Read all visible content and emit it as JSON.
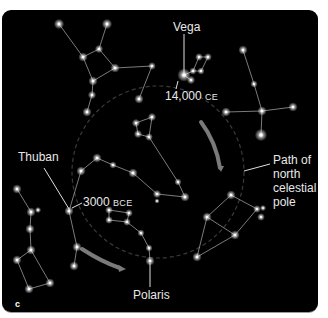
{
  "figure": {
    "panel_letter": "c",
    "background_color": "#000000",
    "star_color": "#ffffff",
    "line_color": "#cfcfcf",
    "arrow_color": "#7a7a7a"
  },
  "labels": {
    "vega": "Vega",
    "year_14000_num": "14,000",
    "year_14000_era": "CE",
    "thuban": "Thuban",
    "year_3000_num": "3000",
    "year_3000_era": "BCE",
    "polaris": "Polaris",
    "path_line1": "Path of",
    "path_line2": "north",
    "path_line3": "celestial",
    "path_line4": "pole"
  },
  "precession_circle": {
    "cx": 158,
    "cy": 172,
    "r": 86
  },
  "stars": [
    [
      59,
      24,
      2
    ],
    [
      107,
      24,
      2
    ],
    [
      99,
      49,
      1.6
    ],
    [
      83,
      57,
      1.8
    ],
    [
      115,
      68,
      1.8
    ],
    [
      152,
      66,
      1.5
    ],
    [
      93,
      81,
      1.8
    ],
    [
      92,
      95,
      1.6
    ],
    [
      87,
      112,
      1.8
    ],
    [
      139,
      99,
      1.8
    ],
    [
      136,
      123,
      1.6
    ],
    [
      152,
      117,
      1.6
    ],
    [
      138,
      134,
      1.6
    ],
    [
      149,
      137,
      1.5
    ],
    [
      184,
      75,
      2.6
    ],
    [
      191,
      80,
      1.6
    ],
    [
      193,
      71,
      1.4
    ],
    [
      201,
      71,
      1.4
    ],
    [
      199,
      57,
      1.5
    ],
    [
      208,
      57,
      1.5
    ],
    [
      243,
      50,
      1.8
    ],
    [
      254,
      84,
      1.4
    ],
    [
      262,
      111,
      1.8
    ],
    [
      226,
      112,
      1.8
    ],
    [
      293,
      107,
      1.8
    ],
    [
      261,
      135,
      2.4
    ],
    [
      97,
      158,
      1.8
    ],
    [
      81,
      171,
      1.8
    ],
    [
      113,
      165,
      1.4
    ],
    [
      133,
      173,
      1.8
    ],
    [
      157,
      194,
      1.6
    ],
    [
      157,
      201,
      1.0
    ],
    [
      178,
      182,
      1.4
    ],
    [
      185,
      197,
      1.8
    ],
    [
      69,
      211,
      1.8
    ],
    [
      77,
      247,
      1.8
    ],
    [
      74,
      266,
      1.8
    ],
    [
      109,
      210,
      1.5
    ],
    [
      129,
      213,
      1.5
    ],
    [
      109,
      220,
      1.5
    ],
    [
      127,
      222,
      1.5
    ],
    [
      141,
      233,
      1.4
    ],
    [
      149,
      248,
      1.4
    ],
    [
      150,
      261,
      1.8
    ],
    [
      17,
      189,
      1.8
    ],
    [
      31,
      212,
      1.8
    ],
    [
      38,
      210,
      1.2
    ],
    [
      30,
      229,
      1.8
    ],
    [
      31,
      250,
      1.8
    ],
    [
      17,
      260,
      1.8
    ],
    [
      29,
      289,
      1.8
    ],
    [
      50,
      283,
      1.8
    ],
    [
      231,
      195,
      1.8
    ],
    [
      257,
      209,
      1.5
    ],
    [
      263,
      208,
      1.2
    ],
    [
      261,
      217,
      1.5
    ],
    [
      207,
      217,
      1.8
    ],
    [
      235,
      235,
      1.8
    ],
    [
      197,
      257,
      1.8
    ]
  ],
  "lines": [
    [
      [
        59,
        24
      ],
      [
        83,
        57
      ]
    ],
    [
      [
        107,
        24
      ],
      [
        99,
        49
      ]
    ],
    [
      [
        99,
        49
      ],
      [
        83,
        57
      ]
    ],
    [
      [
        83,
        57
      ],
      [
        93,
        81
      ]
    ],
    [
      [
        99,
        49
      ],
      [
        115,
        68
      ]
    ],
    [
      [
        115,
        68
      ],
      [
        93,
        81
      ]
    ],
    [
      [
        115,
        68
      ],
      [
        152,
        66
      ]
    ],
    [
      [
        152,
        66
      ],
      [
        139,
        99
      ]
    ],
    [
      [
        93,
        81
      ],
      [
        92,
        95
      ]
    ],
    [
      [
        92,
        95
      ],
      [
        87,
        112
      ]
    ],
    [
      [
        136,
        123
      ],
      [
        152,
        117
      ]
    ],
    [
      [
        152,
        117
      ],
      [
        149,
        137
      ]
    ],
    [
      [
        149,
        137
      ],
      [
        138,
        134
      ]
    ],
    [
      [
        138,
        134
      ],
      [
        136,
        123
      ]
    ],
    [
      [
        149,
        137
      ],
      [
        178,
        182
      ]
    ],
    [
      [
        178,
        182
      ],
      [
        185,
        197
      ]
    ],
    [
      [
        185,
        197
      ],
      [
        157,
        194
      ]
    ],
    [
      [
        184,
        75
      ],
      [
        191,
        80
      ]
    ],
    [
      [
        184,
        75
      ],
      [
        193,
        71
      ]
    ],
    [
      [
        193,
        71
      ],
      [
        201,
        71
      ]
    ],
    [
      [
        193,
        71
      ],
      [
        199,
        57
      ]
    ],
    [
      [
        199,
        57
      ],
      [
        208,
        57
      ]
    ],
    [
      [
        208,
        57
      ],
      [
        201,
        71
      ]
    ],
    [
      [
        243,
        50
      ],
      [
        254,
        84
      ]
    ],
    [
      [
        254,
        84
      ],
      [
        262,
        111
      ]
    ],
    [
      [
        226,
        112
      ],
      [
        262,
        111
      ]
    ],
    [
      [
        262,
        111
      ],
      [
        293,
        107
      ]
    ],
    [
      [
        262,
        111
      ],
      [
        261,
        135
      ]
    ],
    [
      [
        97,
        158
      ],
      [
        81,
        171
      ]
    ],
    [
      [
        97,
        158
      ],
      [
        113,
        165
      ]
    ],
    [
      [
        113,
        165
      ],
      [
        133,
        173
      ]
    ],
    [
      [
        133,
        173
      ],
      [
        157,
        194
      ]
    ],
    [
      [
        81,
        171
      ],
      [
        69,
        211
      ]
    ],
    [
      [
        69,
        211
      ],
      [
        77,
        247
      ]
    ],
    [
      [
        77,
        247
      ],
      [
        74,
        266
      ]
    ],
    [
      [
        109,
        210
      ],
      [
        129,
        213
      ]
    ],
    [
      [
        129,
        213
      ],
      [
        127,
        222
      ]
    ],
    [
      [
        127,
        222
      ],
      [
        109,
        220
      ]
    ],
    [
      [
        109,
        220
      ],
      [
        109,
        210
      ]
    ],
    [
      [
        127,
        222
      ],
      [
        141,
        233
      ]
    ],
    [
      [
        141,
        233
      ],
      [
        149,
        248
      ]
    ],
    [
      [
        149,
        248
      ],
      [
        150,
        261
      ]
    ],
    [
      [
        17,
        189
      ],
      [
        31,
        212
      ]
    ],
    [
      [
        31,
        212
      ],
      [
        30,
        229
      ]
    ],
    [
      [
        30,
        229
      ],
      [
        31,
        250
      ]
    ],
    [
      [
        31,
        250
      ],
      [
        17,
        260
      ]
    ],
    [
      [
        17,
        260
      ],
      [
        29,
        289
      ]
    ],
    [
      [
        29,
        289
      ],
      [
        50,
        283
      ]
    ],
    [
      [
        50,
        283
      ],
      [
        31,
        250
      ]
    ],
    [
      [
        231,
        195
      ],
      [
        257,
        209
      ]
    ],
    [
      [
        257,
        209
      ],
      [
        235,
        235
      ]
    ],
    [
      [
        235,
        235
      ],
      [
        207,
        217
      ]
    ],
    [
      [
        207,
        217
      ],
      [
        231,
        195
      ]
    ],
    [
      [
        207,
        217
      ],
      [
        197,
        257
      ]
    ],
    [
      [
        197,
        257
      ],
      [
        235,
        235
      ]
    ]
  ],
  "leader_lines": [
    [
      [
        184,
        34
      ],
      [
        184,
        73
      ]
    ],
    [
      [
        178,
        81
      ],
      [
        176,
        89
      ]
    ],
    [
      [
        44,
        168
      ],
      [
        69,
        209
      ]
    ],
    [
      [
        72,
        208
      ],
      [
        82,
        203
      ]
    ],
    [
      [
        150,
        263
      ],
      [
        150,
        287
      ]
    ],
    [
      [
        244,
        171
      ],
      [
        270,
        164
      ]
    ]
  ],
  "arrows": [
    {
      "d": "M 201 122 Q 216 142 220 168",
      "head": [
        [
          218,
          166
        ],
        [
          224,
          166
        ],
        [
          221,
          172
        ]
      ]
    },
    {
      "d": "M 82 249 Q 102 262 120 268",
      "head": [
        [
          118,
          265
        ],
        [
          126,
          269
        ],
        [
          119,
          272
        ]
      ]
    }
  ]
}
